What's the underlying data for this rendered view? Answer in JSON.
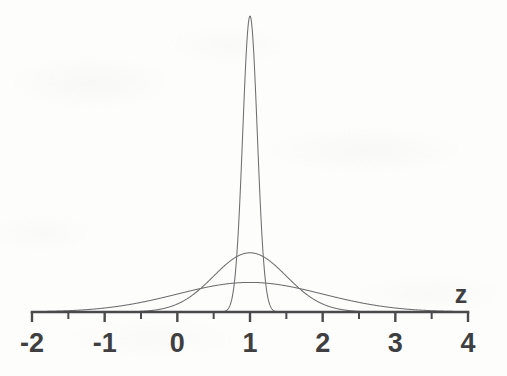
{
  "figure": {
    "background_color": "#fdfdfc",
    "curve_color": "#6e6e70",
    "axis_color": "#4a4a4c",
    "label_color": "#3f3f41"
  },
  "chart_data": {
    "type": "line",
    "title": "",
    "subtitle": "",
    "xlabel": "z",
    "ylabel": "",
    "grid": false,
    "legend": "none",
    "xlim": [
      -2,
      4
    ],
    "ylim": [
      0,
      4.2
    ],
    "x_major_ticks": [
      -2,
      -1,
      0,
      1,
      2,
      3,
      4
    ],
    "x_major_tick_labels": [
      "-2",
      "-1",
      "0",
      "1",
      "2",
      "3",
      "4"
    ],
    "x_minor_ticks": [
      -1.5,
      -0.5,
      0.5,
      1.5,
      2.5,
      3.5
    ],
    "y_axis_visible": false,
    "series": [
      {
        "name": "narrow",
        "function": "gaussian",
        "mean": 1.0,
        "sigma": 0.1,
        "peak_height": 3.99,
        "peak_x": 1.0,
        "relative_peak_px_y": 16
      },
      {
        "name": "medium",
        "function": "gaussian",
        "mean": 1.0,
        "sigma": 0.5,
        "peak_height": 0.798,
        "peak_x": 1.0,
        "relative_peak_px_y": 198
      },
      {
        "name": "broad",
        "function": "gaussian",
        "mean": 1.0,
        "sigma": 1.0,
        "peak_height": 0.399,
        "peak_x": 1.0,
        "relative_peak_px_y": 228
      }
    ]
  },
  "axis": {
    "name_label": "z",
    "tick_labels": [
      "-2",
      "-1",
      "0",
      "1",
      "2",
      "3",
      "4"
    ]
  }
}
